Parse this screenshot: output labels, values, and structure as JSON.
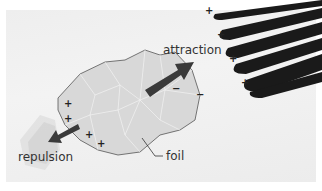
{
  "diagram": {
    "labels": {
      "attraction": "attraction",
      "repulsion": "repulsion",
      "foil": "foil"
    },
    "objects": {
      "foil_piece": "crumpled metal foil",
      "comb": "charged comb"
    },
    "charges": {
      "comb_signs": [
        "+",
        "+",
        "+",
        "+",
        "+"
      ],
      "foil_positive_signs": [
        "+",
        "+",
        "+",
        "+"
      ],
      "foil_negative_signs": [
        "−",
        "−"
      ]
    },
    "colors": {
      "background": "#efefef",
      "comb": "#1a1a1a",
      "arrow": "#3a3a3a",
      "foil": "#d6d6d6"
    }
  }
}
